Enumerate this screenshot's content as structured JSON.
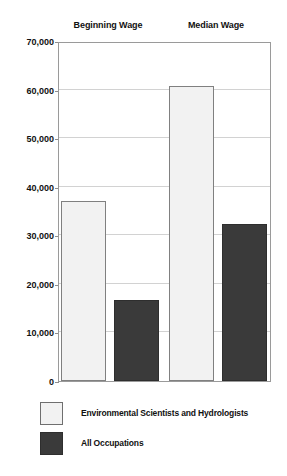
{
  "chart_data": {
    "type": "bar",
    "title": "",
    "xlabel": "",
    "ylabel": "",
    "categories": [
      "Beginning Wage",
      "Median Wage"
    ],
    "series": [
      {
        "name": "Environmental Scientists and Hydrologists",
        "color": "#f2f2f2",
        "values": [
          37000,
          60700
        ]
      },
      {
        "name": "All Occupations",
        "color": "#3a3a3a",
        "values": [
          16700,
          32400
        ]
      }
    ],
    "ylim": [
      0,
      70000
    ],
    "ytick_values": [
      70000,
      60000,
      50000,
      40000,
      30000,
      20000,
      10000,
      0
    ],
    "ytick_labels": [
      "70,000",
      "60,000",
      "50,000",
      "40,000",
      "30,000",
      "20,000",
      "10,000",
      "0"
    ],
    "grid": true,
    "legend_position": "bottom-left"
  },
  "group_headers": [
    {
      "label": "Beginning Wage"
    },
    {
      "label": "Median Wage"
    }
  ],
  "legend": {
    "items": [
      {
        "label": "Environmental Scientists and Hydrologists",
        "swatch": "light"
      },
      {
        "label": "All Occupations",
        "swatch": "dark"
      }
    ]
  }
}
